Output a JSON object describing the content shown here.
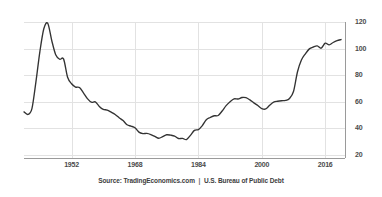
{
  "chart_data": {
    "type": "line",
    "title": "",
    "subtitle": "",
    "xlabel": "",
    "ylabel": "",
    "xlim": [
      1940,
      2021
    ],
    "ylim": [
      20,
      120
    ],
    "grid": true,
    "legend": null,
    "line_color": "#333333",
    "grid_color": "#e2e2e2",
    "axis_color": "#b0b0b0",
    "background": "#ffffff",
    "y_ticks": [
      20,
      40,
      60,
      80,
      100,
      120
    ],
    "y_tick_labels": [
      "20",
      "40",
      "60",
      "80",
      "100",
      "120"
    ],
    "x_ticks": [
      1952,
      1968,
      1984,
      2000,
      2016
    ],
    "x_tick_labels": [
      "1952",
      "1968",
      "1984",
      "2000",
      "2016"
    ],
    "series": [
      {
        "name": "United States Gross Federal Debt to GDP",
        "units": "percent of GDP",
        "x": [
          1940,
          1941,
          1942,
          1943,
          1944,
          1945,
          1946,
          1947,
          1948,
          1949,
          1950,
          1951,
          1952,
          1953,
          1954,
          1955,
          1956,
          1957,
          1958,
          1959,
          1960,
          1961,
          1962,
          1963,
          1964,
          1965,
          1966,
          1967,
          1968,
          1969,
          1970,
          1971,
          1972,
          1973,
          1974,
          1975,
          1976,
          1977,
          1978,
          1979,
          1980,
          1981,
          1982,
          1983,
          1984,
          1985,
          1986,
          1987,
          1988,
          1989,
          1990,
          1991,
          1992,
          1993,
          1994,
          1995,
          1996,
          1997,
          1998,
          1999,
          2000,
          2001,
          2002,
          2003,
          2004,
          2005,
          2006,
          2007,
          2008,
          2009,
          2010,
          2011,
          2012,
          2013,
          2014,
          2015,
          2016,
          2017,
          2018,
          2019,
          2020
        ],
        "values": [
          52.4,
          50.5,
          54.9,
          74.8,
          97.6,
          114.9,
          119.0,
          106.1,
          95.4,
          92.0,
          92.1,
          78.5,
          73.6,
          71.1,
          70.7,
          66.7,
          62.4,
          59.7,
          59.9,
          56.5,
          54.3,
          53.8,
          52.2,
          50.4,
          48.0,
          45.9,
          42.7,
          41.7,
          40.5,
          37.2,
          36.1,
          36.2,
          35.4,
          34.0,
          32.6,
          33.8,
          35.2,
          34.9,
          34.2,
          32.4,
          32.5,
          31.6,
          34.8,
          38.5,
          39.1,
          42.1,
          46.5,
          48.2,
          49.5,
          49.7,
          53.1,
          57.1,
          60.1,
          62.2,
          62.1,
          63.2,
          63.1,
          61.4,
          59.2,
          57.2,
          54.9,
          54.6,
          57.4,
          59.7,
          60.4,
          60.8,
          61.0,
          62.5,
          67.7,
          82.4,
          91.4,
          96.1,
          99.8,
          101.2,
          102.0,
          100.3,
          104.1,
          102.8,
          104.6,
          106.0,
          106.8
        ]
      }
    ],
    "annotations": [],
    "source": {
      "prefix": "Source:",
      "provider": "TradingEconomics.com",
      "separator": "|",
      "publisher": "U.S. Bureau of Public Debt"
    }
  },
  "axes": {
    "y_axis_position": "right",
    "x_axis_position": "bottom"
  }
}
